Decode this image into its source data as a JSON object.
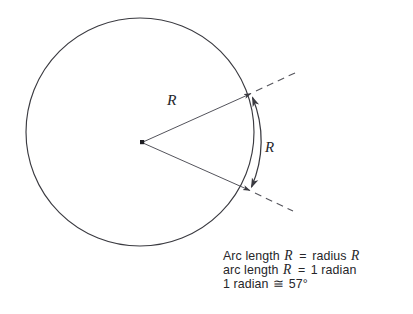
{
  "figure": {
    "type": "geometry-diagram",
    "background_color": "#ffffff",
    "stroke_color": "#3a3a40",
    "text_color": "#26262a"
  },
  "circle": {
    "center_x": 140,
    "center_y": 132,
    "radius": 114,
    "stroke_width": 1.1
  },
  "center_point": {
    "label": "center-dot",
    "x": 142,
    "y": 142,
    "size": 4
  },
  "radii": [
    {
      "name": "upper-radius",
      "label": "R",
      "from_x": 142,
      "from_y": 142,
      "to_x": 252,
      "to_y": 93,
      "label_x": 167,
      "label_y": 101
    },
    {
      "name": "lower-radius",
      "label": "",
      "from_x": 142,
      "from_y": 142,
      "to_x": 251,
      "to_y": 191,
      "label_x": 0,
      "label_y": 0
    }
  ],
  "arc": {
    "name": "arc-length-R",
    "label": "R",
    "start_x": 252,
    "start_y": 93,
    "end_x": 251,
    "end_y": 191,
    "label_x": 268,
    "label_y": 147
  },
  "dashed_extensions": [
    {
      "name": "upper-dashed-extension",
      "from_x": 252,
      "from_y": 93,
      "to_x": 296,
      "to_y": 73
    },
    {
      "name": "lower-dashed-extension",
      "from_x": 251,
      "from_y": 191,
      "to_x": 292,
      "to_y": 210
    }
  ],
  "caption": {
    "lines": [
      {
        "id": "line1",
        "pre": "Arc length",
        "var1": "R",
        "eq": "=",
        "mid": "radius",
        "var2": "R",
        "post": ""
      },
      {
        "id": "line2",
        "pre": "arc length",
        "var1": "R",
        "eq": "=",
        "mid": "1 radian",
        "var2": "",
        "post": ""
      },
      {
        "id": "line3",
        "pre": "1 radian",
        "var1": "",
        "eq": "≅",
        "mid": "57°",
        "var2": "",
        "post": ""
      }
    ]
  }
}
